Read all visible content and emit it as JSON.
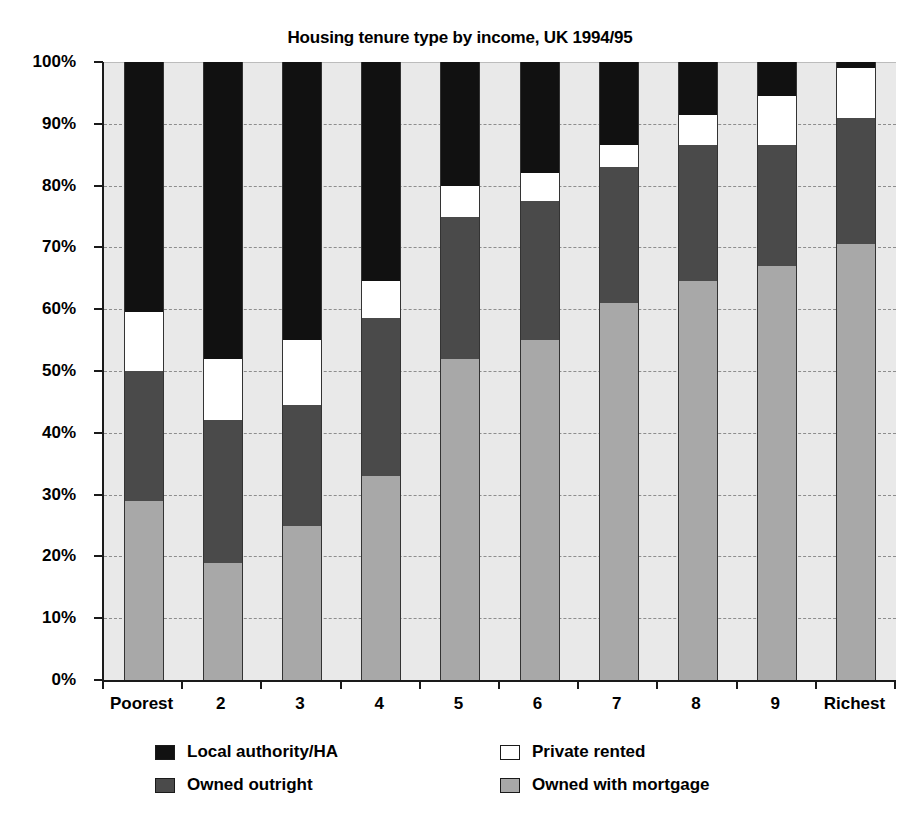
{
  "chart_data": {
    "type": "bar",
    "subtype": "stacked-100-percent",
    "title": "Housing tenure type by income, UK 1994/95",
    "xlabel": "",
    "ylabel": "",
    "ylim": [
      0,
      100
    ],
    "grid": true,
    "legend_position": "bottom",
    "categories": [
      "Poorest",
      "2",
      "3",
      "4",
      "5",
      "6",
      "7",
      "8",
      "9",
      "Richest"
    ],
    "ytick_labels": [
      "100%",
      "90%",
      "80%",
      "70%",
      "60%",
      "50%",
      "40%",
      "30%",
      "20%",
      "10%",
      "0%"
    ],
    "ytick_values": [
      100,
      90,
      80,
      70,
      60,
      50,
      40,
      30,
      20,
      10,
      0
    ],
    "series": [
      {
        "name": "Owned with mortgage",
        "color": "#a8a8a8",
        "values": [
          29,
          19,
          25,
          33,
          52,
          55,
          61,
          64.5,
          67,
          70.5
        ]
      },
      {
        "name": "Owned outright",
        "color": "#4a4a4a",
        "values": [
          21,
          23,
          19.5,
          25.5,
          23,
          22.5,
          22,
          22,
          19.5,
          20.5
        ]
      },
      {
        "name": "Private rented",
        "color": "#ffffff",
        "values": [
          9.5,
          10,
          10.5,
          6,
          5,
          4.5,
          3.5,
          5,
          8,
          8
        ]
      },
      {
        "name": "Local authority/HA",
        "color": "#111111",
        "values": [
          40.5,
          48,
          45,
          35.5,
          20,
          18,
          13.5,
          8.5,
          5.5,
          1
        ]
      }
    ]
  },
  "legend": {
    "items": [
      {
        "label": "Local authority/HA",
        "color": "#111111",
        "swatch": "swatch-local-authority"
      },
      {
        "label": "Private rented",
        "color": "#ffffff",
        "swatch": "swatch-private-rented"
      },
      {
        "label": "Owned outright",
        "color": "#4a4a4a",
        "swatch": "swatch-owned-outright"
      },
      {
        "label": "Owned with mortgage",
        "color": "#a8a8a8",
        "swatch": "swatch-owned-with-mortgage"
      }
    ]
  }
}
